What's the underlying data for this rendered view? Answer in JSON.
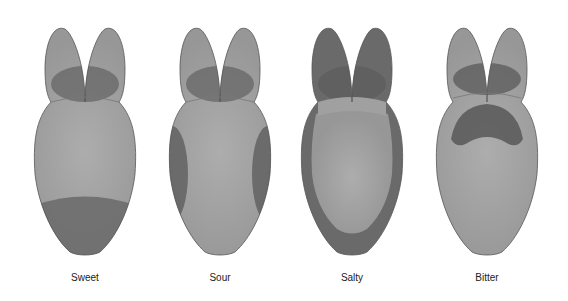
{
  "figure": {
    "type": "tongue-taste-map",
    "colors": {
      "base": "#9a9a9a",
      "light_center": "#a9a9a9",
      "dark_region": "#5e5e5e",
      "outline": "#555555",
      "background": "#ffffff"
    },
    "panels": [
      {
        "label": "Sweet",
        "highlight_region": "tip"
      },
      {
        "label": "Sour",
        "highlight_region": "sides"
      },
      {
        "label": "Salty",
        "highlight_region": "edges-and-tip"
      },
      {
        "label": "Bitter",
        "highlight_region": "back"
      }
    ]
  }
}
